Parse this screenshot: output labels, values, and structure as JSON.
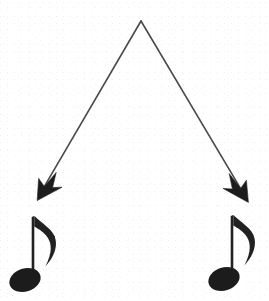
{
  "figure": {
    "type": "diagram",
    "title": "Branching arrow diagram pointing to two eighth notes",
    "description": "An inverted-V line splits from a single apex point into two downward diagonal arrows, each ending above a single eighth note (quaver).",
    "background_color": "#ffffff",
    "ink_color": "#2b2b2b",
    "stroke_color": "#4a4a4a",
    "canvas": {
      "width": 269,
      "height": 301
    }
  },
  "apex": {
    "label": "apex-vertex",
    "x": 141,
    "y": 21
  },
  "branches": [
    {
      "id": "left-branch",
      "label": "Left branch",
      "from_x": 141,
      "from_y": 21,
      "to_x": 37,
      "to_y": 199,
      "arrowhead": "down-left",
      "stroke_width": 1.6
    },
    {
      "id": "right-branch",
      "label": "Right branch",
      "from_x": 141,
      "from_y": 21,
      "to_x": 248,
      "to_y": 201,
      "arrowhead": "down-right",
      "stroke_width": 1.6
    }
  ],
  "notes": [
    {
      "id": "left-eighth-note",
      "label": "Eighth note",
      "glyph_name": "eighth-note",
      "head_cx": 25,
      "head_cy": 280,
      "head_rx": 16,
      "head_ry": 11.5,
      "head_rotation": -18,
      "stem_x": 33,
      "stem_top_y": 216,
      "stem_bottom_y": 282,
      "stem_width": 2.6,
      "flag_direction": "right"
    },
    {
      "id": "right-eighth-note",
      "label": "Eighth note",
      "glyph_name": "eighth-note",
      "head_cx": 224,
      "head_cy": 279,
      "head_rx": 16,
      "head_ry": 11.5,
      "head_rotation": -18,
      "stem_x": 232,
      "stem_top_y": 215,
      "stem_bottom_y": 281,
      "stem_width": 2.6,
      "flag_direction": "right"
    }
  ],
  "annotations": {
    "caption": "",
    "visible_text": []
  }
}
